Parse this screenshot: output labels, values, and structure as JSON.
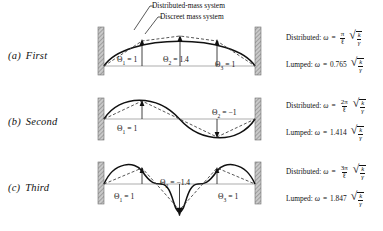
{
  "figure": {
    "callouts": [
      {
        "id": "distributed-mass-system",
        "label": "Distributed-mass system"
      },
      {
        "id": "discreet-mass-system",
        "label": "Discreet mass system"
      }
    ]
  },
  "rows": [
    {
      "enum": "(a)",
      "name": "First",
      "mode_number": 1,
      "amplitudes": [
        {
          "symbol": "Θ",
          "sub": "1",
          "eq": "=",
          "value": "1"
        },
        {
          "symbol": "Θ",
          "sub": "2",
          "eq": "=",
          "value": "1.4"
        },
        {
          "symbol": "Θ",
          "sub": "3",
          "eq": "=",
          "value": "1"
        }
      ],
      "distributed": {
        "lead": "Distributed:",
        "omega": "ω",
        "equals": "=",
        "numerator": "π",
        "denominator": "ℓ",
        "radical_num": "k",
        "radical_den": "γ"
      },
      "lumped": {
        "lead": "Lumped:",
        "omega": "ω",
        "equals": "=",
        "coefficient": "0.765",
        "radical_num": "k",
        "radical_den": "γ"
      }
    },
    {
      "enum": "(b)",
      "name": "Second",
      "mode_number": 2,
      "amplitudes": [
        {
          "symbol": "Θ",
          "sub": "1",
          "eq": "=",
          "value": "1"
        },
        {
          "symbol": "Θ",
          "sub": "2",
          "eq": "=",
          "value": "−1"
        }
      ],
      "distributed": {
        "lead": "Distributed:",
        "omega": "ω",
        "equals": "=",
        "numerator": "2π",
        "denominator": "ℓ",
        "radical_num": "k",
        "radical_den": "γ"
      },
      "lumped": {
        "lead": "Lumped:",
        "omega": "ω",
        "equals": "=",
        "coefficient": "1.414",
        "radical_num": "k",
        "radical_den": "γ"
      }
    },
    {
      "enum": "(c)",
      "name": "Third",
      "mode_number": 3,
      "amplitudes": [
        {
          "symbol": "Θ",
          "sub": "1",
          "eq": "=",
          "value": "1"
        },
        {
          "symbol": "Θ",
          "sub": "2",
          "eq": "=",
          "value": "−1.4"
        },
        {
          "symbol": "Θ",
          "sub": "3",
          "eq": "=",
          "value": "1"
        }
      ],
      "distributed": {
        "lead": "Distributed:",
        "omega": "ω",
        "equals": "=",
        "numerator": "3π",
        "denominator": "ℓ",
        "radical_num": "k",
        "radical_den": "γ"
      },
      "lumped": {
        "lead": "Lumped:",
        "omega": "ω",
        "equals": "=",
        "coefficient": "1.847",
        "radical_num": "k",
        "radical_den": "γ"
      }
    }
  ],
  "colors": {
    "ink": "#111111",
    "wall_fill": "#b3b3b3",
    "axis": "#888888",
    "dashed": "#555555"
  }
}
